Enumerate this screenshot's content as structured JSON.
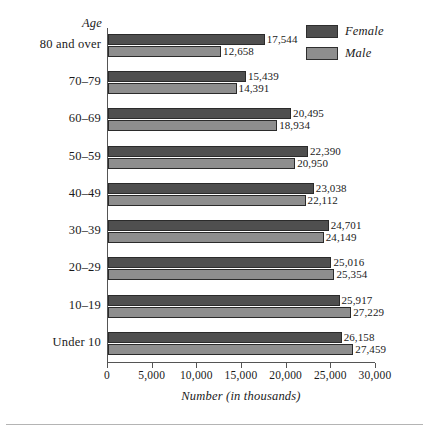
{
  "chart_data": {
    "type": "bar",
    "orientation": "horizontal",
    "title": "",
    "xlabel": "Number (in thousands)",
    "ylabel": "Age",
    "xlim": [
      0,
      30000
    ],
    "grid": false,
    "legend_position": "top-right",
    "xticks": [
      0,
      5000,
      10000,
      15000,
      20000,
      25000,
      30000
    ],
    "xtick_labels": [
      "0",
      "5,000",
      "10,000",
      "15,000",
      "20,000",
      "25,000",
      "30,000"
    ],
    "categories": [
      "80 and over",
      "70–79",
      "60–69",
      "50–59",
      "40–49",
      "30–39",
      "20–29",
      "10–19",
      "Under 10"
    ],
    "series": [
      {
        "name": "Female",
        "color": "#4f4f4f",
        "values": [
          17544,
          15439,
          20495,
          22390,
          23038,
          24701,
          25016,
          25917,
          26158
        ],
        "labels": [
          "17,544",
          "15,439",
          "20,495",
          "22,390",
          "23,038",
          "24,701",
          "25,016",
          "25,917",
          "26,158"
        ]
      },
      {
        "name": "Male",
        "color": "#8e8e8e",
        "values": [
          12658,
          14391,
          18934,
          20950,
          22112,
          24149,
          25354,
          27229,
          27459
        ],
        "labels": [
          "12,658",
          "14,391",
          "18,934",
          "20,950",
          "22,112",
          "24,149",
          "25,354",
          "27,229",
          "27,459"
        ]
      }
    ]
  },
  "legend": {
    "items": [
      {
        "label": "Female",
        "color": "#4f4f4f"
      },
      {
        "label": "Male",
        "color": "#8e8e8e"
      }
    ]
  },
  "axis": {
    "y_title": "Age",
    "x_title": "Number (in thousands)"
  }
}
